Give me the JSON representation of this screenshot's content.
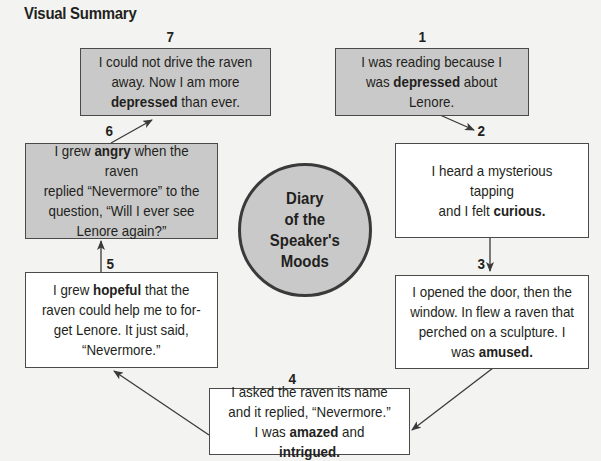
{
  "title": "Visual Summary",
  "center": {
    "lines": [
      "Diary",
      "of the",
      "Speaker's",
      "Moods"
    ]
  },
  "steps": [
    {
      "number": "1",
      "fill": "gray",
      "lines": [
        [
          {
            "t": "I was reading because I"
          }
        ],
        [
          {
            "t": "was "
          },
          {
            "t": "depressed",
            "b": true
          },
          {
            "t": " about"
          }
        ],
        [
          {
            "t": "Lenore."
          }
        ]
      ],
      "mood": "depressed"
    },
    {
      "number": "2",
      "fill": "white",
      "lines": [
        [
          {
            "t": "I heard a mysterious tapping"
          }
        ],
        [
          {
            "t": "and I felt "
          },
          {
            "t": "curious.",
            "b": true
          }
        ]
      ],
      "mood": "curious"
    },
    {
      "number": "3",
      "fill": "white",
      "lines": [
        [
          {
            "t": "I opened the door, then the"
          }
        ],
        [
          {
            "t": "window. In flew a raven that"
          }
        ],
        [
          {
            "t": "perched on a sculpture. I"
          }
        ],
        [
          {
            "t": "was "
          },
          {
            "t": "amused.",
            "b": true
          }
        ]
      ],
      "mood": "amused"
    },
    {
      "number": "4",
      "fill": "white",
      "lines": [
        [
          {
            "t": "I asked the raven its name"
          }
        ],
        [
          {
            "t": "and it replied, “Nevermore.”"
          }
        ],
        [
          {
            "t": "I was "
          },
          {
            "t": "amazed",
            "b": true
          },
          {
            "t": " and "
          },
          {
            "t": "intrigued.",
            "b": true
          }
        ]
      ],
      "mood": "amazed and intrigued"
    },
    {
      "number": "5",
      "fill": "white",
      "lines": [
        [
          {
            "t": "I grew "
          },
          {
            "t": "hopeful",
            "b": true
          },
          {
            "t": " that the"
          }
        ],
        [
          {
            "t": "raven could help me to for-"
          }
        ],
        [
          {
            "t": "get Lenore. It just said,"
          }
        ],
        [
          {
            "t": "“Nevermore.”"
          }
        ]
      ],
      "mood": "hopeful"
    },
    {
      "number": "6",
      "fill": "gray",
      "lines": [
        [
          {
            "t": "I grew "
          },
          {
            "t": "angry",
            "b": true
          },
          {
            "t": " when the raven"
          }
        ],
        [
          {
            "t": "replied “Nevermore” to the"
          }
        ],
        [
          {
            "t": "question, “Will I ever see"
          }
        ],
        [
          {
            "t": "Lenore again?”"
          }
        ]
      ],
      "mood": "angry"
    },
    {
      "number": "7",
      "fill": "gray",
      "lines": [
        [
          {
            "t": "I could not drive the raven"
          }
        ],
        [
          {
            "t": "away. Now I am more"
          }
        ],
        [
          {
            "t": "depressed",
            "b": true
          },
          {
            "t": " than ever."
          }
        ]
      ],
      "mood": "depressed"
    }
  ],
  "colors": {
    "gray_fill": "#c9c9c9",
    "white_fill": "#ffffff",
    "border": "#4a4a4a",
    "background": "#f3f3f1",
    "text": "#231f20"
  }
}
